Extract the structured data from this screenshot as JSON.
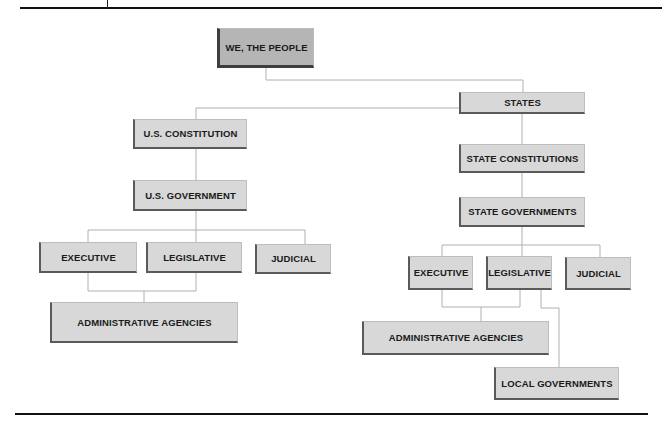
{
  "diagram": {
    "type": "hierarchy",
    "colors": {
      "root_fill": "#b5b5b5",
      "box_fill": "#d8d8d8",
      "box_shadow": "#5a5a5a",
      "connector": "#b0b0b0",
      "rule": "#111111"
    },
    "nodes": {
      "root": "WE, THE PEOPLE",
      "states": "STATES",
      "us_constitution": "U.S. CONSTITUTION",
      "state_constitutions": "STATE CONSTITUTIONS",
      "us_government": "U.S. GOVERNMENT",
      "state_governments": "STATE GOVERNMENTS",
      "federal_executive": "EXECUTIVE",
      "federal_legislative": "LEGISLATIVE",
      "federal_judicial": "JUDICIAL",
      "federal_admin_agencies": "ADMINISTRATIVE AGENCIES",
      "state_executive": "EXECUTIVE",
      "state_legislative": "LEGISLATIVE",
      "state_judicial": "JUDICIAL",
      "state_admin_agencies": "ADMINISTRATIVE AGENCIES",
      "local_governments": "LOCAL GOVERNMENTS"
    },
    "edges": [
      [
        "WE, THE PEOPLE",
        "STATES"
      ],
      [
        "WE, THE PEOPLE",
        "U.S. CONSTITUTION"
      ],
      [
        "U.S. CONSTITUTION",
        "U.S. GOVERNMENT"
      ],
      [
        "U.S. GOVERNMENT",
        "EXECUTIVE"
      ],
      [
        "U.S. GOVERNMENT",
        "LEGISLATIVE"
      ],
      [
        "U.S. GOVERNMENT",
        "JUDICIAL"
      ],
      [
        "EXECUTIVE",
        "ADMINISTRATIVE AGENCIES"
      ],
      [
        "LEGISLATIVE",
        "ADMINISTRATIVE AGENCIES"
      ],
      [
        "STATES",
        "STATE CONSTITUTIONS"
      ],
      [
        "STATE CONSTITUTIONS",
        "STATE GOVERNMENTS"
      ],
      [
        "STATE GOVERNMENTS",
        "EXECUTIVE"
      ],
      [
        "STATE GOVERNMENTS",
        "LEGISLATIVE"
      ],
      [
        "STATE GOVERNMENTS",
        "JUDICIAL"
      ],
      [
        "EXECUTIVE",
        "ADMINISTRATIVE AGENCIES"
      ],
      [
        "LEGISLATIVE",
        "ADMINISTRATIVE AGENCIES"
      ],
      [
        "LEGISLATIVE",
        "LOCAL GOVERNMENTS"
      ]
    ]
  }
}
